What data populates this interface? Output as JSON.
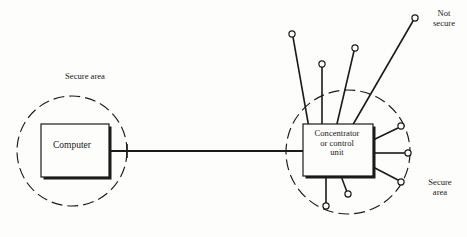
{
  "figure": {
    "background_color": "#fdfdfb",
    "line_color": "#1b1b1b",
    "nodes": {
      "computer": {
        "label": "Computer",
        "shape": "rectangle-with-shadow"
      },
      "concentrator": {
        "label": "Concentrator\nor control\nunit",
        "shape": "rectangle-with-shadow"
      }
    },
    "zones": [
      {
        "id": "secure-area-left",
        "label": "Secure area",
        "boundary": "dashed-circle"
      },
      {
        "id": "not-secure",
        "label": "Not\nsecure",
        "boundary": "none"
      },
      {
        "id": "secure-area-right",
        "label": "Secure\narea",
        "boundary": "dashed-circle"
      }
    ],
    "terminals": {
      "count": 9,
      "symbol": "open-circle"
    },
    "trunk_link": {
      "from": "computer",
      "to": "concentrator",
      "style": "solid-line-with-boundary-tick"
    }
  }
}
